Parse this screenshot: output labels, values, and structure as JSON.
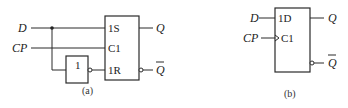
{
  "figure_a": {
    "caption": "(a)",
    "inputs": {
      "d": "D",
      "cp": "CP"
    },
    "not_gate_label": "1",
    "flipflop_pins": {
      "set": "1S",
      "clock": "C1",
      "reset": "1R"
    },
    "outputs": {
      "q": "Q",
      "qbar": "Q"
    }
  },
  "figure_b": {
    "caption": "(b)",
    "inputs": {
      "d": "D",
      "cp": "CP"
    },
    "flipflop_pins": {
      "data": "1D",
      "clock": "C1"
    },
    "outputs": {
      "q": "Q",
      "qbar": "Q"
    }
  }
}
